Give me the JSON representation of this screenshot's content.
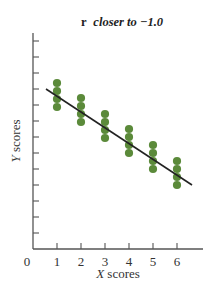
{
  "chart_data": {
    "type": "scatter",
    "title": "r closer to −1.0",
    "title_prefix": "r",
    "title_suffix": "closer to −1.0",
    "xlabel": "X scores",
    "xlabel_var": "X",
    "xlabel_rest": " scores",
    "ylabel": "Y scores",
    "ylabel_var": "Y",
    "ylabel_rest": " scores",
    "origin_label": "0",
    "x_ticks": [
      1,
      2,
      3,
      4,
      5,
      6
    ],
    "y_ticks_count": 13,
    "y_tick_labels": [],
    "xlim": [
      0,
      7
    ],
    "grid": false,
    "legend": null,
    "points": [
      {
        "x": 1,
        "y": [
          4,
          3,
          2,
          1
        ],
        "note": "four stacked points"
      },
      {
        "x": 2,
        "y": [
          4,
          3,
          2,
          1
        ]
      },
      {
        "x": 3,
        "y": [
          4,
          3,
          2,
          1
        ]
      },
      {
        "x": 4,
        "y": [
          4,
          3,
          2,
          1
        ]
      },
      {
        "x": 5,
        "y": [
          4,
          3,
          2,
          1
        ]
      },
      {
        "x": 6,
        "y": [
          4,
          3,
          2,
          1
        ]
      }
    ],
    "point_pixels": [
      {
        "cx": 57,
        "cy": [
          83,
          91,
          99,
          107
        ]
      },
      {
        "cx": 81,
        "cy": [
          98,
          106,
          114,
          122
        ]
      },
      {
        "cx": 105,
        "cy": [
          114,
          122,
          130,
          138
        ]
      },
      {
        "cx": 129,
        "cy": [
          129,
          137,
          145,
          153
        ]
      },
      {
        "cx": 153,
        "cy": [
          145,
          153,
          161,
          169
        ]
      },
      {
        "cx": 177,
        "cy": [
          161,
          169,
          177,
          185
        ]
      }
    ],
    "regression_line": {
      "x1": 46,
      "y1": 89,
      "x2": 192,
      "y2": 185,
      "slope": "negative"
    },
    "correlation": "strong negative (close to -1.0)"
  },
  "colors": {
    "point": "#5b8a3a",
    "line": "#222222",
    "axis": "#555555"
  }
}
